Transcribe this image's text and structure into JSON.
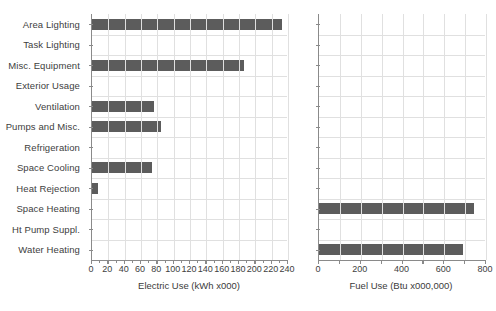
{
  "chart_data": [
    {
      "type": "bar",
      "orientation": "horizontal",
      "panel": "left",
      "title": "",
      "xlabel": "Electric Use (kWh x000)",
      "ylabel": "",
      "xlim": [
        0,
        240
      ],
      "xticks": [
        0,
        20,
        40,
        60,
        80,
        100,
        120,
        140,
        160,
        180,
        200,
        220,
        240
      ],
      "xticklabels": [
        "0",
        "20",
        "40",
        "60",
        "80",
        "100",
        "120",
        "140",
        "160",
        "180",
        "200",
        "220",
        "240"
      ],
      "minor_tick_interval": 10,
      "grid": true,
      "legend": "none",
      "bar_color": "#5c5c5c",
      "categories": [
        "Area Lighting",
        "Task Lighting",
        "Misc. Equipment",
        "Exterior Usage",
        "Ventilation",
        "Pumps and Misc.",
        "Refrigeration",
        "Space Cooling",
        "Heat Rejection",
        "Space Heating",
        "Ht Pump Suppl.",
        "Water Heating"
      ],
      "values": [
        233,
        0,
        186,
        0,
        76,
        85,
        0,
        73,
        7,
        0,
        0,
        0
      ]
    },
    {
      "type": "bar",
      "orientation": "horizontal",
      "panel": "right",
      "title": "",
      "xlabel": "Fuel Use (Btu x000,000)",
      "ylabel": "",
      "xlim": [
        0,
        800
      ],
      "xticks": [
        0,
        100,
        200,
        300,
        400,
        500,
        600,
        700,
        800
      ],
      "xticklabels": [
        "0",
        "",
        "200",
        "",
        "400",
        "",
        "600",
        "",
        "800"
      ],
      "minor_tick_interval": 100,
      "grid": true,
      "legend": "none",
      "bar_color": "#5c5c5c",
      "categories": [
        "Area Lighting",
        "Task Lighting",
        "Misc. Equipment",
        "Exterior Usage",
        "Ventilation",
        "Pumps and Misc.",
        "Refrigeration",
        "Space Cooling",
        "Heat Rejection",
        "Space Heating",
        "Ht Pump Suppl.",
        "Water Heating"
      ],
      "values": [
        0,
        0,
        0,
        0,
        0,
        0,
        0,
        0,
        0,
        742,
        0,
        689
      ]
    }
  ],
  "footer": {
    "text": ""
  },
  "colors": {
    "bar": "#5c5c5c",
    "axis": "#8a8a8a",
    "grid": "#e0e0e0",
    "text": "#3b3b3b",
    "background": "#ffffff"
  }
}
